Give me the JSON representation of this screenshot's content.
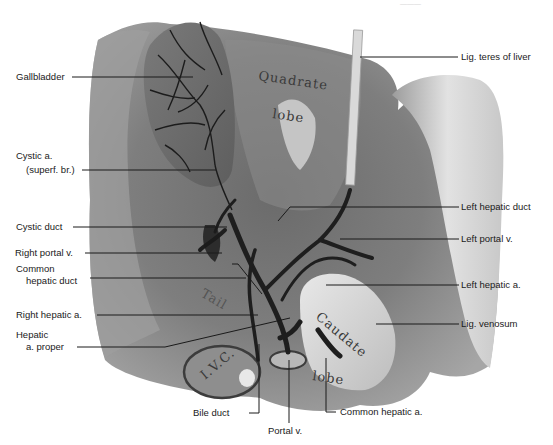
{
  "figure": {
    "type": "anatomical illustration",
    "organ_text": {
      "quadrate_1": "Quadrate",
      "quadrate_2": "lobe",
      "caudate_1": "Caudate",
      "caudate_2": "lobe",
      "tail": "Tail",
      "ivc": "I.V.C."
    }
  },
  "labels": {
    "left": [
      {
        "id": "gallbladder",
        "lines": [
          "Gallbladder"
        ]
      },
      {
        "id": "cystic-a",
        "lines": [
          "Cystic a.",
          "(superf. br.)"
        ]
      },
      {
        "id": "cystic-duct",
        "lines": [
          "Cystic duct"
        ]
      },
      {
        "id": "right-portal-v",
        "lines": [
          "Right portal v."
        ]
      },
      {
        "id": "common-hepatic-duct",
        "lines": [
          "Common",
          "hepatic duct"
        ]
      },
      {
        "id": "right-hepatic-a",
        "lines": [
          "Right hepatic a."
        ]
      },
      {
        "id": "hepatic-a-proper",
        "lines": [
          "Hepatic",
          "a. proper"
        ]
      }
    ],
    "right": [
      {
        "id": "lig-teres",
        "lines": [
          "Lig. teres of liver"
        ]
      },
      {
        "id": "left-hepatic-duct",
        "lines": [
          "Left hepatic duct"
        ]
      },
      {
        "id": "left-portal-v",
        "lines": [
          "Left portal v."
        ]
      },
      {
        "id": "left-hepatic-a",
        "lines": [
          "Left hepatic a."
        ]
      },
      {
        "id": "lig-venosum",
        "lines": [
          "Lig. venosum"
        ]
      }
    ],
    "bottom": [
      {
        "id": "bile-duct",
        "lines": [
          "Bile duct"
        ]
      },
      {
        "id": "portal-v",
        "lines": [
          "Portal v."
        ]
      },
      {
        "id": "common-hepatic-a",
        "lines": [
          "Common hepatic a."
        ]
      }
    ]
  },
  "colors": {
    "background": "#ffffff",
    "liver_dark": "#5a5a5a",
    "liver_mid": "#8a8a8a",
    "liver_light": "#cfcfcf",
    "vessel": "#1e1e1e",
    "leader_line": "#1a1a1a"
  }
}
